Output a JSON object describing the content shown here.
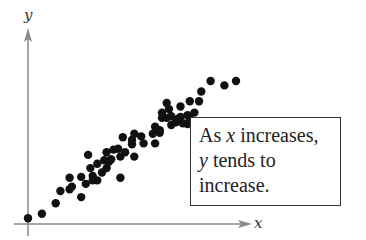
{
  "chart_data": {
    "type": "scatter",
    "title": "",
    "xlabel": "x",
    "ylabel": "y",
    "grid": false,
    "ticks": "none",
    "xlim": [
      0,
      10
    ],
    "ylim": [
      0,
      10
    ],
    "annotation": {
      "line1_prefix": "As ",
      "line1_var": "x",
      "line1_suffix": " increases,",
      "line2_var": "y",
      "line2_suffix": " tends to",
      "line3": "increase."
    },
    "trend": "positive correlation",
    "points_px_note": "points given in data coordinates (0-10 scale) estimated from pixel positions",
    "points": [
      [
        0.0,
        0.1
      ],
      [
        0.6,
        0.35
      ],
      [
        1.2,
        0.95
      ],
      [
        1.4,
        1.65
      ],
      [
        1.8,
        1.75
      ],
      [
        1.9,
        1.9
      ],
      [
        2.3,
        1.3
      ],
      [
        1.8,
        2.4
      ],
      [
        2.3,
        2.45
      ],
      [
        2.5,
        2.05
      ],
      [
        2.8,
        2.25
      ],
      [
        3.0,
        2.25
      ],
      [
        2.7,
        2.95
      ],
      [
        3.0,
        3.2
      ],
      [
        2.8,
        2.5
      ],
      [
        3.2,
        2.7
      ],
      [
        3.4,
        2.95
      ],
      [
        3.3,
        3.4
      ],
      [
        3.5,
        3.3
      ],
      [
        3.4,
        3.85
      ],
      [
        3.7,
        4.0
      ],
      [
        3.6,
        3.45
      ],
      [
        4.0,
        3.6
      ],
      [
        3.9,
        4.05
      ],
      [
        4.0,
        2.4
      ],
      [
        4.2,
        3.85
      ],
      [
        4.6,
        3.6
      ],
      [
        4.5,
        4.3
      ],
      [
        2.6,
        3.7
      ],
      [
        4.1,
        4.7
      ],
      [
        4.5,
        4.55
      ],
      [
        4.9,
        4.75
      ],
      [
        4.6,
        4.9
      ],
      [
        5.0,
        4.35
      ],
      [
        5.5,
        5.3
      ],
      [
        5.4,
        4.9
      ],
      [
        5.7,
        5.1
      ],
      [
        5.7,
        4.95
      ],
      [
        5.5,
        4.35
      ],
      [
        5.8,
        6.1
      ],
      [
        6.1,
        6.3
      ],
      [
        5.8,
        5.8
      ],
      [
        6.0,
        5.8
      ],
      [
        6.2,
        5.4
      ],
      [
        6.5,
        5.75
      ],
      [
        6.6,
        5.85
      ],
      [
        6.9,
        5.95
      ],
      [
        7.0,
        5.75
      ],
      [
        6.9,
        5.45
      ],
      [
        6.7,
        5.5
      ],
      [
        6.2,
        5.9
      ],
      [
        6.4,
        5.55
      ],
      [
        6.0,
        6.65
      ],
      [
        6.6,
        6.45
      ],
      [
        7.0,
        6.75
      ],
      [
        7.4,
        6.75
      ],
      [
        7.5,
        7.3
      ],
      [
        7.2,
        6.1
      ],
      [
        7.9,
        7.9
      ],
      [
        8.5,
        7.65
      ],
      [
        9.0,
        7.9
      ]
    ]
  },
  "axes": {
    "x_label": "x",
    "y_label": "y",
    "axis_color": "#888888",
    "dot_color": "#111111"
  },
  "note": {
    "line1_prefix": "As ",
    "line1_var": "x",
    "line1_suffix": " increases,",
    "line2_var": "y",
    "line2_suffix": " tends to",
    "line3": "increase."
  }
}
